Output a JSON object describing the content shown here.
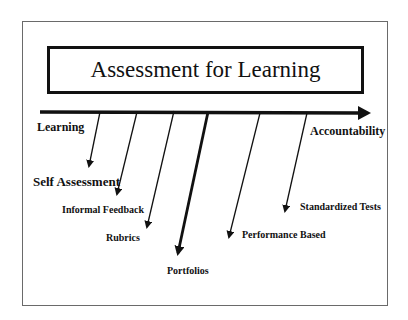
{
  "diagram": {
    "title": "Assessment for Learning",
    "axis": {
      "left_label": "Learning",
      "right_label": "Accountability"
    },
    "items": [
      {
        "label": "Self Assessment"
      },
      {
        "label": "Informal Feedback"
      },
      {
        "label": "Rubrics"
      },
      {
        "label": "Portfolios"
      },
      {
        "label": "Performance Based"
      },
      {
        "label": "Standardized Tests"
      }
    ]
  }
}
